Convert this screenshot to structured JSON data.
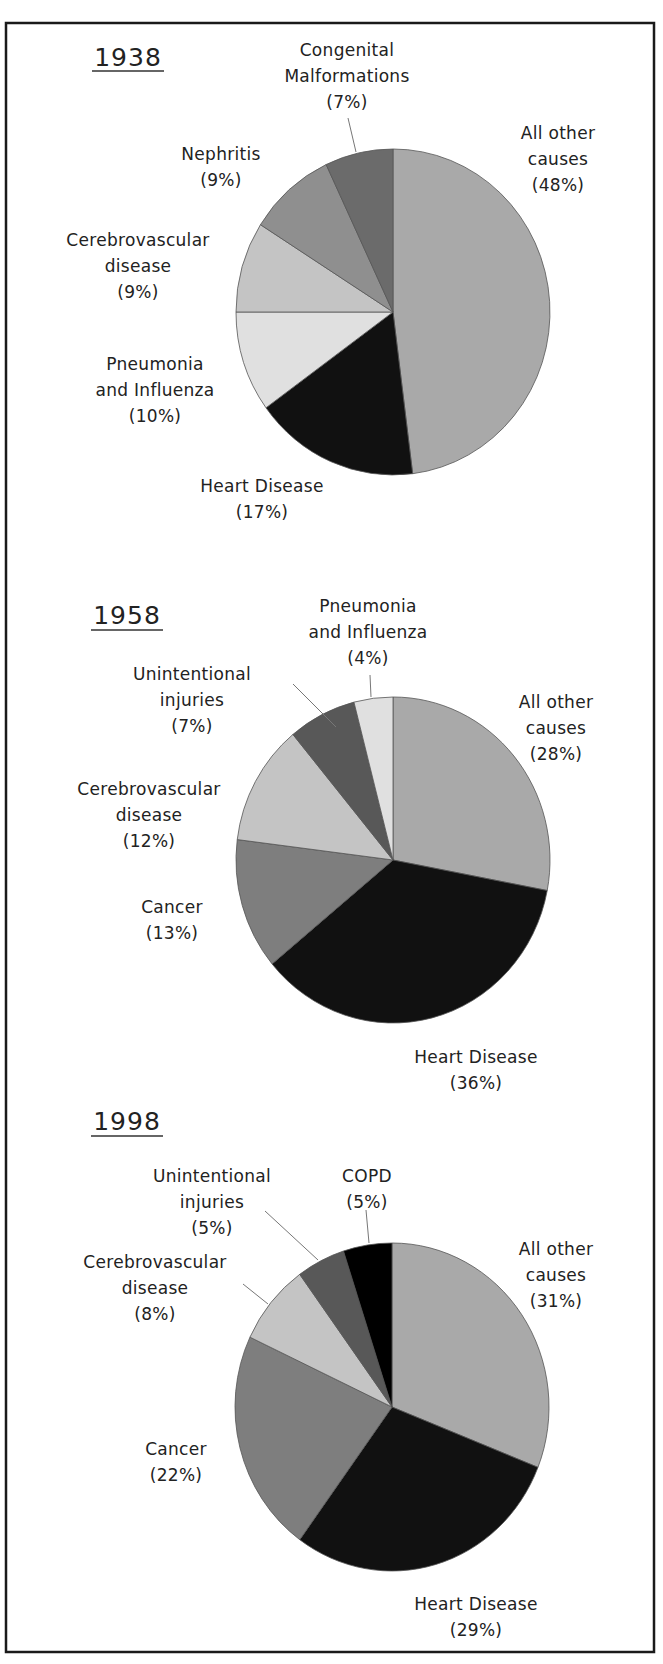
{
  "chart_data": [
    {
      "type": "pie",
      "title": "1938",
      "categories": [
        "All other causes",
        "Heart Disease",
        "Pneumonia and Influenza",
        "Cerebrovascular disease",
        "Nephritis",
        "Congenital Malformations"
      ],
      "values": [
        48,
        17,
        10,
        9,
        9,
        7
      ],
      "unit": "%",
      "start_angle_deg": 0,
      "direction": "clockwise-from-top",
      "colors": [
        "#a9a9a9",
        "#111111",
        "#e0e0e0",
        "#c4c4c4",
        "#8f8f8f",
        "#6b6b6b"
      ],
      "labels": [
        {
          "lines": [
            "All other",
            "causes",
            "(48%)"
          ],
          "x": 558,
          "y": 139
        },
        {
          "lines": [
            "Heart Disease",
            "(17%)"
          ],
          "x": 262,
          "y": 492
        },
        {
          "lines": [
            "Pneumonia",
            "and Influenza",
            "(10%)"
          ],
          "x": 155,
          "y": 370
        },
        {
          "lines": [
            "Cerebrovascular",
            "disease",
            "(9%)"
          ],
          "x": 138,
          "y": 246
        },
        {
          "lines": [
            "Nephritis",
            "(9%)"
          ],
          "x": 221,
          "y": 160
        },
        {
          "lines": [
            "Congenital",
            "Malformations",
            "(7%)"
          ],
          "x": 347,
          "y": 56
        }
      ],
      "leaders": [
        [
          348,
          118,
          356,
          152
        ]
      ]
    },
    {
      "type": "pie",
      "title": "1958",
      "categories": [
        "All other causes",
        "Heart Disease",
        "Cancer",
        "Cerebrovascular disease",
        "Unintentional injuries",
        "Pneumonia and Influenza"
      ],
      "values": [
        28,
        36,
        13,
        12,
        7,
        4
      ],
      "unit": "%",
      "start_angle_deg": 0,
      "direction": "clockwise-from-top",
      "colors": [
        "#a9a9a9",
        "#111111",
        "#7e7e7e",
        "#c4c4c4",
        "#585858",
        "#e0e0e0"
      ],
      "labels": [
        {
          "lines": [
            "All other",
            "causes",
            "(28%)"
          ],
          "x": 556,
          "y": 708
        },
        {
          "lines": [
            "Heart Disease",
            "(36%)"
          ],
          "x": 476,
          "y": 1063
        },
        {
          "lines": [
            "Cancer",
            "(13%)"
          ],
          "x": 172,
          "y": 913
        },
        {
          "lines": [
            "Cerebrovascular",
            "disease",
            "(12%)"
          ],
          "x": 149,
          "y": 795
        },
        {
          "lines": [
            "Unintentional",
            "injuries",
            "(7%)"
          ],
          "x": 192,
          "y": 680
        },
        {
          "lines": [
            "Pneumonia",
            "and Influenza",
            "(4%)"
          ],
          "x": 368,
          "y": 612
        }
      ],
      "leaders": [
        [
          293,
          684,
          336,
          727
        ],
        [
          370,
          675,
          371,
          697
        ]
      ]
    },
    {
      "type": "pie",
      "title": "1998",
      "categories": [
        "All other causes",
        "Heart Disease",
        "Cancer",
        "Cerebrovascular disease",
        "Unintentional injuries",
        "COPD"
      ],
      "values": [
        31,
        29,
        22,
        8,
        5,
        5
      ],
      "unit": "%",
      "start_angle_deg": 0,
      "direction": "clockwise-from-top",
      "colors": [
        "#a9a9a9",
        "#111111",
        "#7e7e7e",
        "#c4c4c4",
        "#585858",
        "#000000"
      ],
      "labels": [
        {
          "lines": [
            "All other",
            "causes",
            "(31%)"
          ],
          "x": 556,
          "y": 1255
        },
        {
          "lines": [
            "Heart Disease",
            "(29%)"
          ],
          "x": 476,
          "y": 1610
        },
        {
          "lines": [
            "Cancer",
            "(22%)"
          ],
          "x": 176,
          "y": 1455
        },
        {
          "lines": [
            "Cerebrovascular",
            "disease",
            "(8%)"
          ],
          "x": 155,
          "y": 1268
        },
        {
          "lines": [
            "Unintentional",
            "injuries",
            "(5%)"
          ],
          "x": 212,
          "y": 1182
        },
        {
          "lines": [
            "COPD",
            "(5%)"
          ],
          "x": 367,
          "y": 1182
        }
      ],
      "leaders": [
        [
          265,
          1211,
          318,
          1260
        ],
        [
          243,
          1284,
          268,
          1304
        ],
        [
          366,
          1210,
          369,
          1243
        ]
      ]
    }
  ],
  "layout": {
    "frame": {
      "x": 6,
      "y": 23,
      "w": 648,
      "h": 1629
    },
    "pies": [
      {
        "cx": 393,
        "cy": 312,
        "rx": 157,
        "ry": 163,
        "year_x": 128,
        "year_y": 66,
        "underline_y": 71
      },
      {
        "cx": 393,
        "cy": 860,
        "rx": 157,
        "ry": 163,
        "year_x": 127,
        "year_y": 624,
        "underline_y": 630
      },
      {
        "cx": 392,
        "cy": 1407,
        "rx": 157,
        "ry": 164,
        "year_x": 127,
        "year_y": 1130,
        "underline_y": 1136
      }
    ],
    "line_height": 26
  }
}
